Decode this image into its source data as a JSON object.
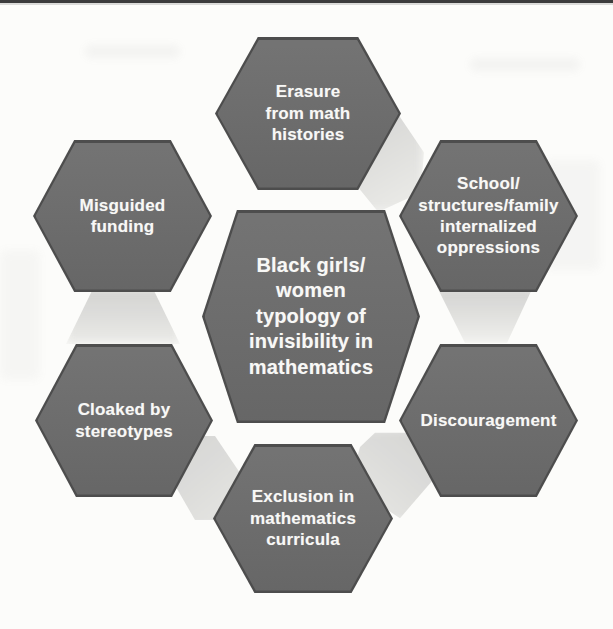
{
  "page": {
    "background": "#fcfcfa",
    "top_rule_color": "#3c3c3c"
  },
  "diagram": {
    "type": "hexagon-cluster",
    "hex_fill": "#6c6c6c",
    "hex_border": "#4d4d4d",
    "label_color": "#f8f8f6",
    "shadow_color": "#d0d0ce",
    "center": {
      "label": "Black girls/\nwomen\ntypology of\ninvisibility in\nmathematics"
    },
    "nodes": [
      {
        "position": "top",
        "label": "Erasure\nfrom math\nhistories"
      },
      {
        "position": "upper-right",
        "label": "School/\nstructures/family\ninternalized\noppressions"
      },
      {
        "position": "lower-right",
        "label": "Discouragement"
      },
      {
        "position": "bottom",
        "label": "Exclusion in\nmathematics\ncurricula"
      },
      {
        "position": "lower-left",
        "label": "Cloaked by\nstereotypes"
      },
      {
        "position": "upper-left",
        "label": "Misguided\nfunding"
      }
    ]
  }
}
